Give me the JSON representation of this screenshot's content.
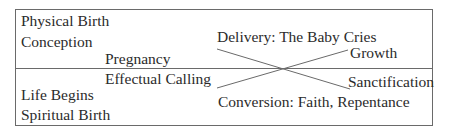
{
  "diagram": {
    "top_half": {
      "title": "Physical Birth",
      "stage1": "Conception",
      "stage2": "Pregnancy",
      "stage3": "Delivery: The Baby Cries",
      "stage4": "Growth"
    },
    "bottom_half": {
      "title": "Spiritual Birth",
      "stage1": "Life Begins",
      "stage2": "Effectual Calling",
      "stage3": "Conversion: Faith, Repentance",
      "stage4": "Sanctification"
    },
    "colors": {
      "line": "#6a6a6a",
      "text": "#2b2b2b",
      "background": "#ffffff"
    }
  }
}
